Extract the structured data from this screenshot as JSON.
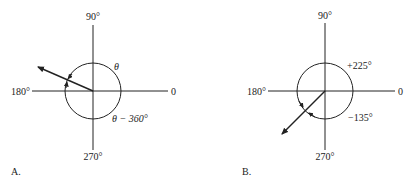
{
  "panels": [
    {
      "id": "A",
      "caption": "A.",
      "axis_labels": {
        "top": "90°",
        "left": "180°",
        "right": "0",
        "bottom": "270°"
      },
      "angle_labels": {
        "positive": "θ",
        "negative": "θ − 360°"
      },
      "vector_direction_deg": 155
    },
    {
      "id": "B",
      "caption": "B.",
      "axis_labels": {
        "top": "90°",
        "left": "180°",
        "right": "0",
        "bottom": "270°"
      },
      "angle_labels": {
        "positive": "+225°",
        "negative": "−135°"
      },
      "vector_direction_deg": 225
    }
  ],
  "colors": {
    "ink": "#222222",
    "background": "#ffffff"
  }
}
